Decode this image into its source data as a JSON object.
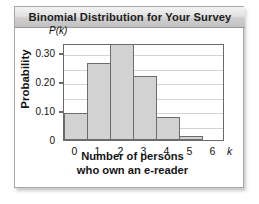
{
  "panel": {
    "title": "Binomial Distribution for Your Survey"
  },
  "chart_data": {
    "type": "bar",
    "title": "Binomial Distribution for Your Survey",
    "xlabel_line1": "Number of persons",
    "xlabel_line2": "who own an e-reader",
    "xvariable": "k",
    "ylabel": "Probability",
    "ytop_caption": "P(k)",
    "categories": [
      "0",
      "1",
      "2",
      "3",
      "4",
      "5",
      "6"
    ],
    "values": [
      0.095,
      0.265,
      0.34,
      0.22,
      0.08,
      0.015,
      0.0
    ],
    "xticklabels": [
      "0",
      "1",
      "2",
      "3",
      "4",
      "5",
      "6"
    ],
    "yticklabels": [
      "0",
      "0.10",
      "0.20",
      "0.30"
    ],
    "ytickvalues": [
      0,
      0.1,
      0.2,
      0.3
    ],
    "ylim": [
      0,
      0.335
    ],
    "xlim": [
      -0.5,
      6.5
    ],
    "gridlines_at": [
      0.05,
      0.1,
      0.15,
      0.2,
      0.25,
      0.3
    ],
    "grid": true,
    "legend": null,
    "bar_fill": "#d2d2d2",
    "bar_edge": "#6d6d6d"
  }
}
